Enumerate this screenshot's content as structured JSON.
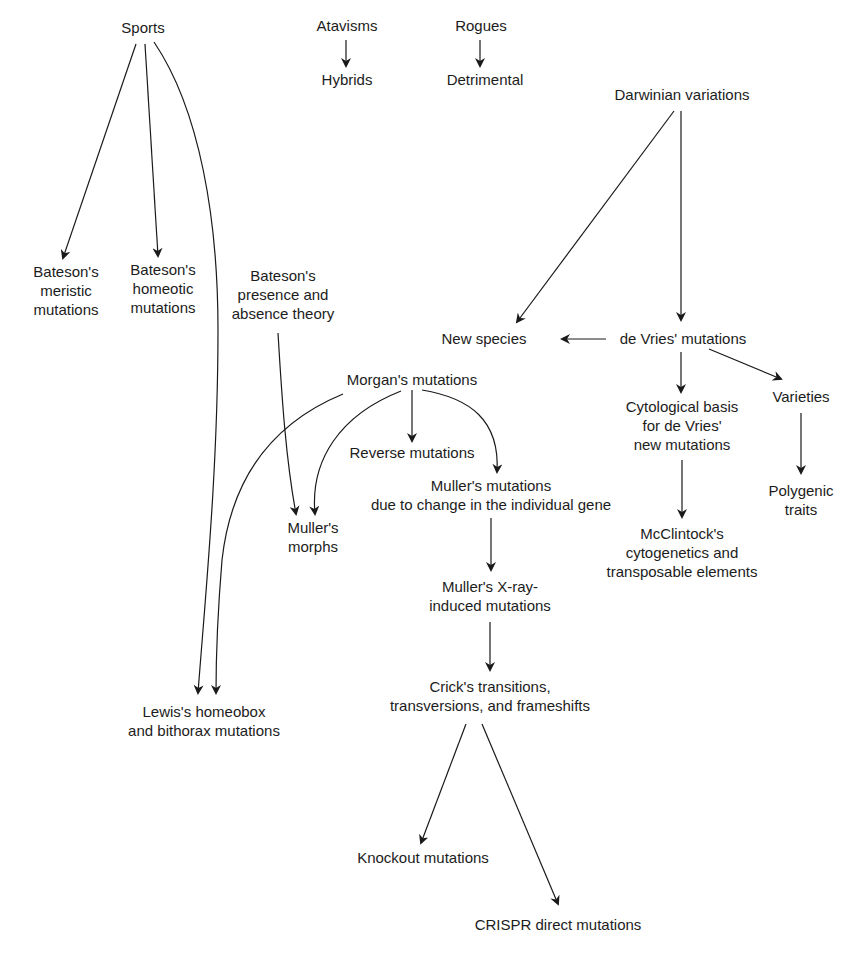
{
  "diagram": {
    "type": "concept-flow",
    "nodes": {
      "sports": {
        "lines": [
          "Sports"
        ]
      },
      "atavisms": {
        "lines": [
          "Atavisms"
        ]
      },
      "hybrids": {
        "lines": [
          "Hybrids"
        ]
      },
      "rogues": {
        "lines": [
          "Rogues"
        ]
      },
      "detrimental": {
        "lines": [
          "Detrimental"
        ]
      },
      "darwinian": {
        "lines": [
          "Darwinian variations"
        ]
      },
      "bateson_meristic": {
        "lines": [
          "Bateson's",
          "meristic",
          "mutations"
        ]
      },
      "bateson_homeotic": {
        "lines": [
          "Bateson's",
          "homeotic",
          "mutations"
        ]
      },
      "bateson_presence": {
        "lines": [
          "Bateson's",
          "presence and",
          "absence theory"
        ]
      },
      "new_species": {
        "lines": [
          "New species"
        ]
      },
      "de_vries": {
        "lines": [
          "de Vries' mutations"
        ]
      },
      "morgan": {
        "lines": [
          "Morgan's mutations"
        ]
      },
      "cytological": {
        "lines": [
          "Cytological basis",
          "for de Vries'",
          "new mutations"
        ]
      },
      "varieties": {
        "lines": [
          "Varieties"
        ]
      },
      "reverse": {
        "lines": [
          "Reverse mutations"
        ]
      },
      "muller_gene": {
        "lines": [
          "Muller's mutations",
          "due to change in the individual gene"
        ]
      },
      "polygenic": {
        "lines": [
          "Polygenic",
          "traits"
        ]
      },
      "muller_morphs": {
        "lines": [
          "Muller's",
          "morphs"
        ]
      },
      "mcclintock": {
        "lines": [
          "McClintock's",
          "cytogenetics and",
          "transposable elements"
        ]
      },
      "muller_xray": {
        "lines": [
          "Muller's X-ray-",
          "induced mutations"
        ]
      },
      "crick": {
        "lines": [
          "Crick's transitions,",
          "transversions, and frameshifts"
        ]
      },
      "lewis": {
        "lines": [
          "Lewis's homeobox",
          "and bithorax mutations"
        ]
      },
      "knockout": {
        "lines": [
          "Knockout mutations"
        ]
      },
      "crispr": {
        "lines": [
          "CRISPR direct mutations"
        ]
      }
    },
    "edges": [
      {
        "from": "sports",
        "to": "bateson_meristic"
      },
      {
        "from": "sports",
        "to": "bateson_homeotic"
      },
      {
        "from": "sports",
        "to": "lewis"
      },
      {
        "from": "atavisms",
        "to": "hybrids"
      },
      {
        "from": "rogues",
        "to": "detrimental"
      },
      {
        "from": "darwinian",
        "to": "new_species"
      },
      {
        "from": "darwinian",
        "to": "de_vries"
      },
      {
        "from": "de_vries",
        "to": "new_species"
      },
      {
        "from": "de_vries",
        "to": "cytological"
      },
      {
        "from": "de_vries",
        "to": "varieties"
      },
      {
        "from": "varieties",
        "to": "polygenic"
      },
      {
        "from": "cytological",
        "to": "mcclintock"
      },
      {
        "from": "bateson_presence",
        "to": "muller_morphs"
      },
      {
        "from": "morgan",
        "to": "lewis"
      },
      {
        "from": "morgan",
        "to": "muller_morphs"
      },
      {
        "from": "morgan",
        "to": "reverse"
      },
      {
        "from": "morgan",
        "to": "muller_gene"
      },
      {
        "from": "muller_gene",
        "to": "muller_xray"
      },
      {
        "from": "muller_xray",
        "to": "crick"
      },
      {
        "from": "crick",
        "to": "knockout"
      },
      {
        "from": "crick",
        "to": "crispr"
      }
    ],
    "colors": {
      "line": "#1a1a1a",
      "text": "#1c1c1c",
      "background": "#ffffff"
    }
  }
}
